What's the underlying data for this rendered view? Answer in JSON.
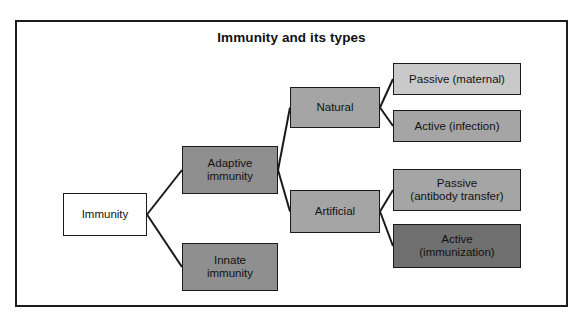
{
  "figure": {
    "title": "Immunity and its types",
    "frame": {
      "border_color": "#1c1c1c",
      "background": "#ffffff"
    }
  },
  "palette": {
    "white": "#ffffff",
    "light_gray": "#c9c9c9",
    "mid_gray": "#a5a5a5",
    "dark_gray": "#8f8f8f",
    "darker_gray": "#6f6f6f",
    "outline": "#1a1a1a",
    "text": "#121212"
  },
  "diagram": {
    "type": "tree",
    "orientation": "left-to-right",
    "nodes": [
      {
        "id": "immunity",
        "label": "Immunity",
        "tone": "white",
        "level": 0,
        "x": 63,
        "y": 193,
        "w": 84,
        "h": 43
      },
      {
        "id": "adaptive",
        "label": "Adaptive\nimmunity",
        "tone": "dark",
        "level": 1,
        "x": 182,
        "y": 146,
        "w": 96,
        "h": 48
      },
      {
        "id": "innate",
        "label": "Innate\nimmunity",
        "tone": "dark",
        "level": 1,
        "x": 182,
        "y": 243,
        "w": 96,
        "h": 48
      },
      {
        "id": "natural",
        "label": "Natural",
        "tone": "mid",
        "level": 2,
        "x": 290,
        "y": 87,
        "w": 90,
        "h": 41
      },
      {
        "id": "artificial",
        "label": "Artificial",
        "tone": "mid",
        "level": 2,
        "x": 290,
        "y": 190,
        "w": 90,
        "h": 43
      },
      {
        "id": "passive-maternal",
        "label": "Passive (maternal)",
        "tone": "light",
        "level": 3,
        "x": 393,
        "y": 63,
        "w": 128,
        "h": 32
      },
      {
        "id": "active-infection",
        "label": "Active (infection)",
        "tone": "mid",
        "level": 3,
        "x": 393,
        "y": 110,
        "w": 128,
        "h": 32
      },
      {
        "id": "passive-antibody-transfer",
        "label": "Passive\n(antibody transfer)",
        "tone": "mid",
        "level": 3,
        "x": 393,
        "y": 169,
        "w": 128,
        "h": 42
      },
      {
        "id": "active-immunization",
        "label": "Active\n(immunization)",
        "tone": "darker",
        "level": 3,
        "x": 393,
        "y": 224,
        "w": 128,
        "h": 44
      }
    ],
    "edges": [
      {
        "from": "immunity",
        "to": "adaptive"
      },
      {
        "from": "immunity",
        "to": "innate"
      },
      {
        "from": "adaptive",
        "to": "natural"
      },
      {
        "from": "adaptive",
        "to": "artificial"
      },
      {
        "from": "natural",
        "to": "passive-maternal"
      },
      {
        "from": "natural",
        "to": "active-infection"
      },
      {
        "from": "artificial",
        "to": "passive-antibody-transfer"
      },
      {
        "from": "artificial",
        "to": "active-immunization"
      }
    ]
  }
}
